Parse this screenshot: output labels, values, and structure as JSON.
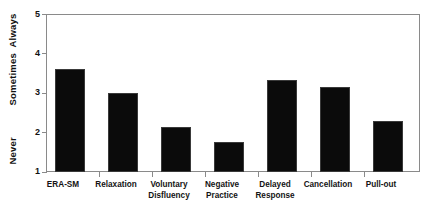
{
  "chart_data": {
    "type": "bar",
    "title": "",
    "subtitle": "",
    "xlabel": "",
    "ylabel": "",
    "categories": [
      "ERA-SM",
      "Relaxation",
      "Voluntary\nDisfluency",
      "Negative\nPractice",
      "Delayed\nResponse",
      "Cancellation",
      "Pull-out"
    ],
    "values": [
      3.6,
      3.0,
      2.15,
      1.75,
      3.33,
      3.15,
      2.3
    ],
    "ylim": [
      1,
      5
    ],
    "yticks": [
      1,
      2,
      3,
      4,
      5
    ],
    "ytick_labels": [
      "1",
      "2",
      "3",
      "4",
      "5"
    ],
    "y_category_labels": [
      {
        "text": "Never",
        "value": 1
      },
      {
        "text": "Sometimes",
        "value": 3
      },
      {
        "text": "Always",
        "value": 5
      }
    ],
    "grid": false,
    "legend": null,
    "bar_color": "#0b0b0b",
    "frame_color": "#8a8a8a",
    "background": "#ffffff"
  },
  "axis": {
    "y_labels": {
      "always": "Always",
      "sometimes": "Sometimes",
      "never": "Never"
    }
  }
}
